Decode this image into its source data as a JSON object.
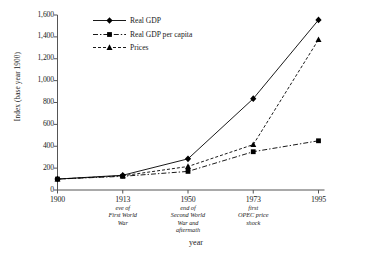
{
  "chart_data": {
    "type": "line",
    "title": "",
    "xlabel": "year",
    "ylabel": "Index (base year 1900)",
    "x": [
      1900,
      1913,
      1950,
      1973,
      1995
    ],
    "categories": [
      "1900",
      "1913",
      "1950",
      "1973",
      "1995"
    ],
    "xtick_annotations": [
      "",
      "eve of\nFirst World\nWar",
      "end of\nSecond World\nWar and\naftermath",
      "first\nOPEC price\nshock",
      ""
    ],
    "ylim": [
      0,
      1600
    ],
    "yticks": [
      0,
      200,
      400,
      600,
      800,
      1000,
      1200,
      1400,
      1600
    ],
    "ytick_labels": [
      "0",
      "200",
      "400",
      "600",
      "800",
      "1,000",
      "1,200",
      "1,400",
      "1,600"
    ],
    "grid": false,
    "legend_position": "upper-left-inside",
    "series": [
      {
        "name": "Real GDP",
        "values": [
          100,
          135,
          285,
          835,
          1555
        ],
        "marker": "diamond",
        "line_style": "solid",
        "color": "#000000"
      },
      {
        "name": "Real GDP per capita",
        "values": [
          100,
          125,
          170,
          350,
          450
        ],
        "marker": "square",
        "line_style": "dash-dot",
        "color": "#000000"
      },
      {
        "name": "Prices",
        "values": [
          100,
          130,
          215,
          415,
          1375
        ],
        "marker": "triangle",
        "line_style": "dashed",
        "color": "#000000"
      }
    ]
  },
  "axis": {
    "y_title": "Index (base year 1900)",
    "x_title": "year"
  },
  "colors": {
    "ink": "#000000",
    "axis": "#555555",
    "background": "#ffffff"
  }
}
